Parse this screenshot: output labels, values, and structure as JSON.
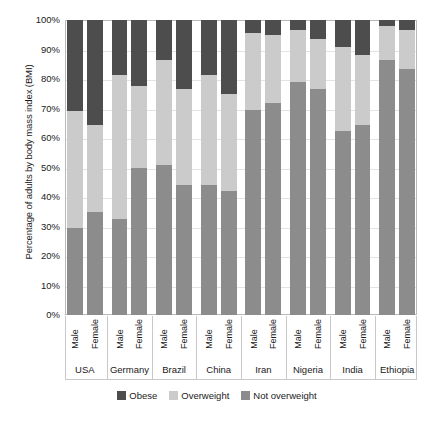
{
  "chart_data": {
    "type": "bar",
    "subtype": "stacked-bar-100-percent",
    "title": "",
    "xlabel": "",
    "ylabel": "Percentage of adults by body mass index (BMI)",
    "ylim": [
      0,
      100
    ],
    "ytick_labels": [
      "100%",
      "90%",
      "80%",
      "70%",
      "60%",
      "50%",
      "40%",
      "30%",
      "20%",
      "10%",
      "0%"
    ],
    "ytick_values": [
      100,
      90,
      80,
      70,
      60,
      50,
      40,
      30,
      20,
      10,
      0
    ],
    "grid": true,
    "legend_position": "bottom",
    "stack_order_bottom_to_top": [
      "Not overweight",
      "Overweight",
      "Obese"
    ],
    "groups": [
      "USA",
      "Germany",
      "Brazil",
      "China",
      "Iran",
      "Nigeria",
      "India",
      "Ethiopia"
    ],
    "subcategories": [
      "Male",
      "Female"
    ],
    "categories": [
      "USA Male",
      "USA Female",
      "Germany Male",
      "Germany Female",
      "Brazil Male",
      "Brazil Female",
      "China Male",
      "China Female",
      "Iran Male",
      "Iran Female",
      "Nigeria Male",
      "Nigeria Female",
      "India Male",
      "India Female",
      "Ethiopia Male",
      "Ethiopia Female"
    ],
    "series": [
      {
        "name": "Not overweight",
        "color": "#8c8c8c",
        "values": [
          29.5,
          35,
          32.5,
          50,
          51,
          44,
          44,
          42,
          69.5,
          72,
          79,
          76.5,
          62.5,
          64.5,
          86.5,
          83.5
        ]
      },
      {
        "name": "Overweight",
        "color": "#cbcbcb",
        "values": [
          39.5,
          29.5,
          49,
          27.5,
          35.5,
          32.5,
          37.5,
          33,
          26,
          23,
          17.5,
          17,
          28.5,
          23.5,
          11.5,
          13
        ]
      },
      {
        "name": "Obese",
        "color": "#4d4d4d",
        "values": [
          31,
          35.5,
          18.5,
          22.5,
          13.5,
          23.5,
          18.5,
          25,
          4.5,
          5,
          3.5,
          6.5,
          9,
          12,
          2,
          3.5
        ]
      }
    ],
    "bars": [
      {
        "group": "USA",
        "sex": "Male",
        "not_overweight": 29.5,
        "overweight": 39.5,
        "obese": 31
      },
      {
        "group": "USA",
        "sex": "Female",
        "not_overweight": 35,
        "overweight": 29.5,
        "obese": 35.5
      },
      {
        "group": "Germany",
        "sex": "Male",
        "not_overweight": 32.5,
        "overweight": 49,
        "obese": 18.5
      },
      {
        "group": "Germany",
        "sex": "Female",
        "not_overweight": 50,
        "overweight": 27.5,
        "obese": 22.5
      },
      {
        "group": "Brazil",
        "sex": "Male",
        "not_overweight": 51,
        "overweight": 35.5,
        "obese": 13.5
      },
      {
        "group": "Brazil",
        "sex": "Female",
        "not_overweight": 44,
        "overweight": 32.5,
        "obese": 23.5
      },
      {
        "group": "China",
        "sex": "Male",
        "not_overweight": 44,
        "overweight": 37.5,
        "obese": 18.5
      },
      {
        "group": "China",
        "sex": "Female",
        "not_overweight": 42,
        "overweight": 33,
        "obese": 25
      },
      {
        "group": "Iran",
        "sex": "Male",
        "not_overweight": 69.5,
        "overweight": 26,
        "obese": 4.5
      },
      {
        "group": "Iran",
        "sex": "Female",
        "not_overweight": 72,
        "overweight": 23,
        "obese": 5
      },
      {
        "group": "Nigeria",
        "sex": "Male",
        "not_overweight": 79,
        "overweight": 17.5,
        "obese": 3.5
      },
      {
        "group": "Nigeria",
        "sex": "Female",
        "not_overweight": 76.5,
        "overweight": 17,
        "obese": 6.5
      },
      {
        "group": "India",
        "sex": "Male",
        "not_overweight": 62.5,
        "overweight": 28.5,
        "obese": 9
      },
      {
        "group": "India",
        "sex": "Female",
        "not_overweight": 64.5,
        "overweight": 23.5,
        "obese": 12
      },
      {
        "group": "Ethiopia",
        "sex": "Male",
        "not_overweight": 86.5,
        "overweight": 11.5,
        "obese": 2
      },
      {
        "group": "Ethiopia",
        "sex": "Female",
        "not_overweight": 83.5,
        "overweight": 13,
        "obese": 3.5
      }
    ],
    "legend": [
      {
        "label": "Obese",
        "color": "#4d4d4d"
      },
      {
        "label": "Overweight",
        "color": "#cbcbcb"
      },
      {
        "label": "Not overweight",
        "color": "#8c8c8c"
      }
    ]
  }
}
